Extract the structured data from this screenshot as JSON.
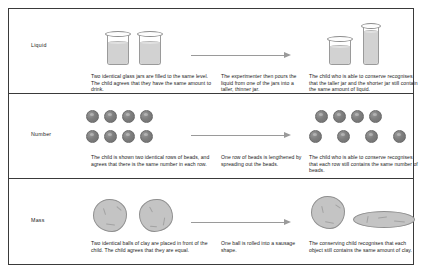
{
  "figure": {
    "rows": [
      {
        "label": "Liquid",
        "captions": {
          "before": "Two identical glass jars are filled to the same level. The child agrees that they have the same amount to drink.",
          "transform": "The experimenter then pours the liquid from one of the jars into a taller, thinner jar.",
          "after": "The child who is able to conserve recognises that the taller jar and the shorter jar still contain the same amount of liquid."
        },
        "arrow_icon": "right-arrow-icon",
        "before_objects": "two-identical-jars",
        "after_objects": "short-jar-and-tall-thin-jar"
      },
      {
        "label": "Number",
        "captions": {
          "before": "The child is shown two identical rows of beads, and agrees that there is the same number in each row.",
          "transform": "One row of beads is lengthened by spreading out the beads.",
          "after": "The child who is able to conserve recognises that each row still contains the same number of beads."
        },
        "arrow_icon": "right-arrow-icon",
        "before_objects": "two-equal-rows-of-four-beads",
        "after_objects": "compact-row-and-spread-row-of-four-beads"
      },
      {
        "label": "Mass",
        "captions": {
          "before": "Two identical balls of clay are placed in front of the child. The child agrees that they are equal.",
          "transform": "One ball is rolled into a sausage shape.",
          "after": "The conserving child recognises that each object still contains the same amount of clay."
        },
        "arrow_icon": "right-arrow-icon",
        "before_objects": "two-identical-clay-balls",
        "after_objects": "clay-ball-and-clay-sausage"
      }
    ],
    "colors": {
      "border": "#3a3a3a",
      "arrow": "#9a9a9a",
      "bead": "#7e7e7e",
      "clay": "#c4c4c4",
      "liquid": "#d2d2d2",
      "text": "#1a1a1a"
    }
  }
}
